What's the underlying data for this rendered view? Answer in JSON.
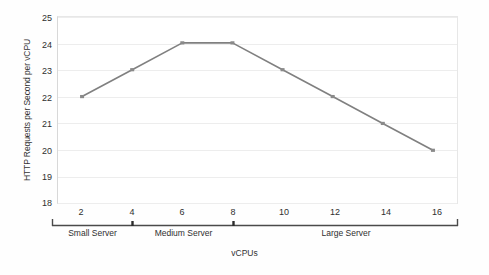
{
  "chart_data": {
    "type": "line",
    "title": "",
    "xlabel": "vCPUs",
    "ylabel": "HTTP Requests per Second per vCPU",
    "x": [
      2,
      4,
      6,
      8,
      10,
      12,
      14,
      16
    ],
    "values": [
      22,
      23,
      24,
      24,
      23,
      22,
      21,
      20
    ],
    "series": [
      {
        "name": "HTTP Requests per Second per vCPU",
        "values": [
          22,
          23,
          24,
          24,
          23,
          22,
          21,
          20
        ]
      }
    ],
    "xlim": [
      1,
      17
    ],
    "ylim": [
      18,
      25
    ],
    "y_ticks": [
      25,
      24,
      23,
      22,
      21,
      20,
      19,
      18
    ],
    "x_ticks": [
      2,
      4,
      6,
      8,
      10,
      12,
      14,
      16
    ],
    "grid": true,
    "legend": "none",
    "line_color": "#808080",
    "marker_color": "#8a8a8a",
    "gridline_color": "#ededed",
    "plot_border_color": "#e7e7e7",
    "background_color": "#ffffff",
    "annotations": [
      {
        "label": "Small Server",
        "from": 1,
        "to": 4
      },
      {
        "label": "Medium Server",
        "from": 4,
        "to": 8
      },
      {
        "label": "Large Server",
        "from": 8,
        "to": 17
      }
    ]
  },
  "axis": {
    "y_tick_labels": [
      "25",
      "24",
      "23",
      "22",
      "21",
      "20",
      "19",
      "18"
    ],
    "x_tick_labels": [
      "2",
      "4",
      "6",
      "8",
      "10",
      "12",
      "14",
      "16"
    ],
    "y_title": "HTTP Requests per Second per vCPU",
    "x_title": "vCPUs"
  },
  "groups": [
    {
      "label": "Small Server"
    },
    {
      "label": "Medium Server"
    },
    {
      "label": "Large Server"
    }
  ]
}
